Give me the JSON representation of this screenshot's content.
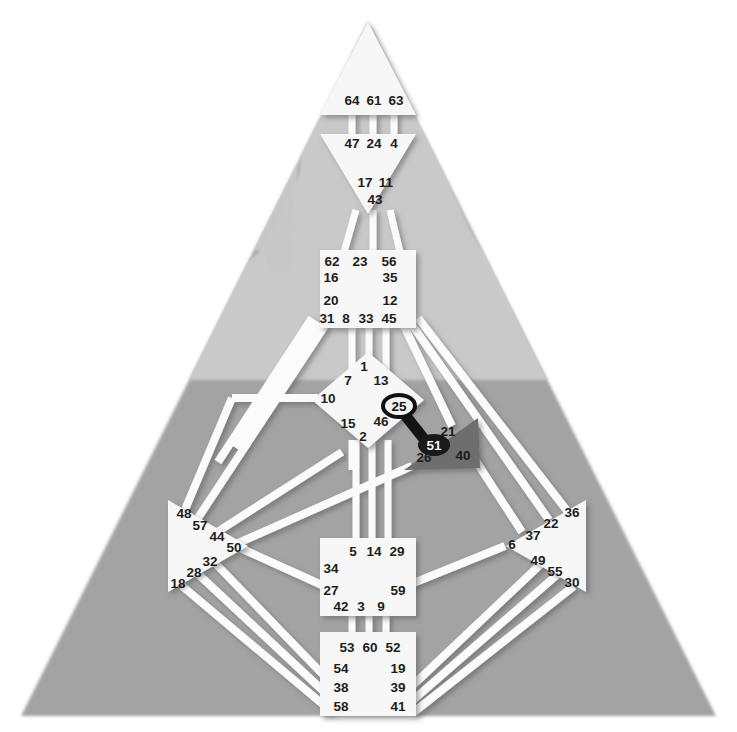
{
  "meta": {
    "subject_silhouette": "human-head-and-shoulders",
    "background_color": "#ffffff"
  },
  "palette": {
    "body_triangle": "#a3a3a3",
    "body_triangle_light": "#c9c9c9",
    "head_silhouette": "#c5c5c5",
    "center_defined_fill": "#f7f7f7",
    "center_open_fill": "#f7f7f7",
    "ego_center_fill": "#6e6e6e",
    "channel_white": "#fbfbfb",
    "channel_shadow": "#8c8c8c",
    "activated_channel": "#141414",
    "gate_text": "#1d1d1d",
    "gate_text_light": "#f2f2f2"
  },
  "centers": [
    {
      "id": "head",
      "name": "Head Center",
      "shape": "triangle-up",
      "fill": "#f7f7f7",
      "gates": [
        {
          "num": "64",
          "x": 352,
          "y": 105
        },
        {
          "num": "61",
          "x": 374,
          "y": 105
        },
        {
          "num": "63",
          "x": 395,
          "y": 105
        }
      ]
    },
    {
      "id": "ajna",
      "name": "Ajna Center",
      "shape": "triangle-down",
      "fill": "#f7f7f7",
      "gates": [
        {
          "num": "47",
          "x": 352,
          "y": 148
        },
        {
          "num": "24",
          "x": 374,
          "y": 148
        },
        {
          "num": "4",
          "x": 394,
          "y": 148
        },
        {
          "num": "17",
          "x": 365,
          "y": 186
        },
        {
          "num": "11",
          "x": 386,
          "y": 186
        },
        {
          "num": "43",
          "x": 375,
          "y": 203
        }
      ]
    },
    {
      "id": "throat",
      "name": "Throat Center",
      "shape": "square",
      "fill": "#f7f7f7",
      "gates": [
        {
          "num": "62",
          "x": 332,
          "y": 261
        },
        {
          "num": "23",
          "x": 359,
          "y": 261
        },
        {
          "num": "56",
          "x": 388,
          "y": 261
        },
        {
          "num": "16",
          "x": 331,
          "y": 277
        },
        {
          "num": "35",
          "x": 389,
          "y": 277
        },
        {
          "num": "20",
          "x": 331,
          "y": 300
        },
        {
          "num": "12",
          "x": 389,
          "y": 300
        },
        {
          "num": "31",
          "x": 325,
          "y": 318
        },
        {
          "num": "8",
          "x": 345,
          "y": 318
        },
        {
          "num": "33",
          "x": 364,
          "y": 318
        },
        {
          "num": "45",
          "x": 386,
          "y": 318
        }
      ]
    },
    {
      "id": "g",
      "name": "G Center / Identity",
      "shape": "diamond",
      "fill": "#f7f7f7",
      "gates": [
        {
          "num": "1",
          "x": 363,
          "y": 366
        },
        {
          "num": "7",
          "x": 348,
          "y": 379
        },
        {
          "num": "13",
          "x": 379,
          "y": 379
        },
        {
          "num": "10",
          "x": 328,
          "y": 397
        },
        {
          "num": "15",
          "x": 348,
          "y": 423
        },
        {
          "num": "46",
          "x": 379,
          "y": 421
        },
        {
          "num": "2",
          "x": 362,
          "y": 436
        },
        {
          "num": "25",
          "x": 399,
          "y": 406,
          "activated": true,
          "ring": true
        }
      ]
    },
    {
      "id": "ego",
      "name": "Heart / Ego Center",
      "shape": "triangle-right",
      "fill": "#6e6e6e",
      "gates": [
        {
          "num": "21",
          "x": 447,
          "y": 431
        },
        {
          "num": "51",
          "x": 434,
          "y": 444,
          "activated": true,
          "light_text": true
        },
        {
          "num": "26",
          "x": 424,
          "y": 457
        },
        {
          "num": "40",
          "x": 462,
          "y": 455
        }
      ]
    },
    {
      "id": "spleen",
      "name": "Spleen Center",
      "shape": "triangle-left",
      "fill": "#f7f7f7",
      "gates": [
        {
          "num": "48",
          "x": 183,
          "y": 513
        },
        {
          "num": "57",
          "x": 199,
          "y": 524
        },
        {
          "num": "44",
          "x": 215,
          "y": 536
        },
        {
          "num": "50",
          "x": 232,
          "y": 546
        },
        {
          "num": "32",
          "x": 209,
          "y": 560
        },
        {
          "num": "28",
          "x": 193,
          "y": 571
        },
        {
          "num": "18",
          "x": 177,
          "y": 582
        }
      ]
    },
    {
      "id": "solar_plexus",
      "name": "Solar Plexus / Emotional Center",
      "shape": "triangle-right",
      "fill": "#f7f7f7",
      "gates": [
        {
          "num": "36",
          "x": 571,
          "y": 511
        },
        {
          "num": "22",
          "x": 549,
          "y": 522
        },
        {
          "num": "37",
          "x": 531,
          "y": 535
        },
        {
          "num": "6",
          "x": 511,
          "y": 543
        },
        {
          "num": "49",
          "x": 536,
          "y": 559
        },
        {
          "num": "55",
          "x": 553,
          "y": 570
        },
        {
          "num": "30",
          "x": 570,
          "y": 581
        }
      ]
    },
    {
      "id": "sacral",
      "name": "Sacral Center",
      "shape": "square",
      "fill": "#f7f7f7",
      "gates": [
        {
          "num": "5",
          "x": 352,
          "y": 551
        },
        {
          "num": "14",
          "x": 372,
          "y": 551
        },
        {
          "num": "29",
          "x": 395,
          "y": 551
        },
        {
          "num": "34",
          "x": 329,
          "y": 567
        },
        {
          "num": "27",
          "x": 329,
          "y": 589
        },
        {
          "num": "59",
          "x": 396,
          "y": 589
        },
        {
          "num": "42",
          "x": 339,
          "y": 605
        },
        {
          "num": "3",
          "x": 359,
          "y": 605
        },
        {
          "num": "9",
          "x": 379,
          "y": 605
        }
      ]
    },
    {
      "id": "root",
      "name": "Root Center",
      "shape": "square",
      "fill": "#f7f7f7",
      "gates": [
        {
          "num": "53",
          "x": 346,
          "y": 646
        },
        {
          "num": "60",
          "x": 369,
          "y": 646
        },
        {
          "num": "52",
          "x": 392,
          "y": 646
        },
        {
          "num": "54",
          "x": 340,
          "y": 667
        },
        {
          "num": "19",
          "x": 396,
          "y": 667
        },
        {
          "num": "38",
          "x": 340,
          "y": 686
        },
        {
          "num": "39",
          "x": 396,
          "y": 686
        },
        {
          "num": "58",
          "x": 340,
          "y": 705
        },
        {
          "num": "41",
          "x": 396,
          "y": 705
        }
      ]
    }
  ],
  "activated_channel": {
    "name": "channel-25-51",
    "from_gate": "25",
    "to_gate": "51",
    "color": "#141414",
    "label": "Channel of Initiation"
  },
  "gate_count": 64
}
